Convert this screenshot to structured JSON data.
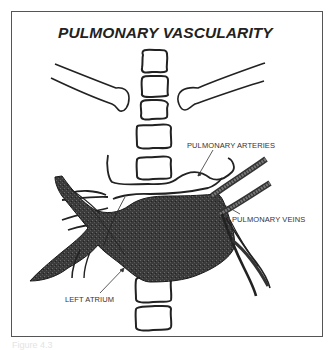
{
  "figure": {
    "title": "PULMONARY VASCULARITY",
    "labels": {
      "pulmonary_arteries": "PULMONARY ARTERIES",
      "pulmonary_veins": "PULMONARY VEINS",
      "left_atrium": "LEFT ATRIUM"
    },
    "caption": "Figure 4.3"
  },
  "colors": {
    "outline": "#222222",
    "vessel_fill": "#3a3a3a",
    "frame": "#555555",
    "background": "#ffffff"
  },
  "structures": [
    "spine-vertebrae",
    "clavicles",
    "pulmonary-arteries",
    "pulmonary-veins",
    "left-atrium"
  ]
}
